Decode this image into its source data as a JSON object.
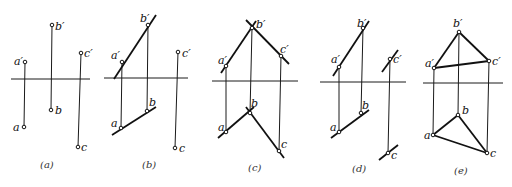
{
  "figure": {
    "panels": [
      {
        "id": "a",
        "caption": "(a)",
        "points": [
          {
            "name": "a",
            "front_label": "a′",
            "top_label": "a"
          },
          {
            "name": "b",
            "front_label": "b′",
            "top_label": "b"
          },
          {
            "name": "c",
            "front_label": "c′",
            "top_label": "c"
          }
        ],
        "connections": []
      },
      {
        "id": "b",
        "caption": "(b)",
        "points": [
          {
            "name": "a",
            "front_label": "a′",
            "top_label": "a"
          },
          {
            "name": "b",
            "front_label": "b′",
            "top_label": "b"
          },
          {
            "name": "c",
            "front_label": "c′",
            "top_label": "c"
          }
        ],
        "connections": [
          "a-b line (extended)"
        ]
      },
      {
        "id": "c",
        "caption": "(c)",
        "points": [
          {
            "name": "a",
            "front_label": "a′",
            "top_label": "a"
          },
          {
            "name": "b",
            "front_label": "b′",
            "top_label": "b"
          },
          {
            "name": "c",
            "front_label": "c′",
            "top_label": "c"
          }
        ],
        "connections": [
          "a-b line (extended)",
          "b-c line (extended)"
        ]
      },
      {
        "id": "d",
        "caption": "(d)",
        "points": [
          {
            "name": "a",
            "front_label": "a′",
            "top_label": "a"
          },
          {
            "name": "b",
            "front_label": "b′",
            "top_label": "b"
          },
          {
            "name": "c",
            "front_label": "c′",
            "top_label": "c"
          }
        ],
        "connections": [
          "a-b line (extended)",
          "line through c parallel to ab"
        ]
      },
      {
        "id": "e",
        "caption": "(e)",
        "points": [
          {
            "name": "a",
            "front_label": "a′",
            "top_label": "a"
          },
          {
            "name": "b",
            "front_label": "b′",
            "top_label": "b"
          },
          {
            "name": "c",
            "front_label": "c′",
            "top_label": "c"
          }
        ],
        "connections": [
          "triangle abc"
        ]
      }
    ]
  }
}
